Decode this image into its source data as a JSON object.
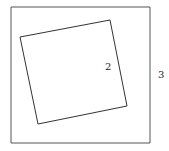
{
  "diagram": {
    "outer_square": {
      "points": "11,7 150,7 150,143 11,143",
      "label": "3",
      "label_x": 158,
      "label_y": 78
    },
    "inner_square": {
      "points": "20,37 110,20 127,106 38,124",
      "label": "2",
      "label_x": 105,
      "label_y": 70
    },
    "stroke_color": "#444444",
    "background": "#ffffff"
  }
}
